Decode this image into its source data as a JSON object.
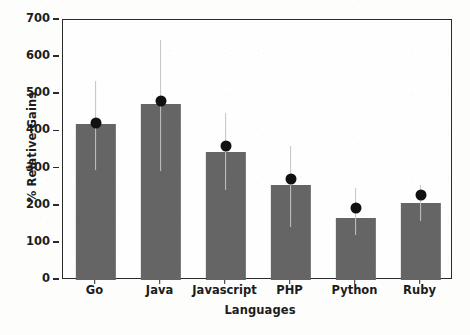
{
  "chart_data": {
    "type": "bar",
    "title": "",
    "xlabel": "Languages",
    "ylabel": "% Relative Gains",
    "categories": [
      "Go",
      "Java",
      "Javascript",
      "PHP",
      "Python",
      "Ruby"
    ],
    "values": [
      420,
      473,
      345,
      255,
      168,
      207
    ],
    "markers": [
      423,
      483,
      360,
      272,
      193,
      230
    ],
    "error_low": [
      295,
      293,
      243,
      144,
      120,
      159
    ],
    "error_high": [
      535,
      645,
      450,
      362,
      248,
      257
    ],
    "ylim": [
      0,
      700
    ],
    "yticks": [
      0,
      100,
      200,
      300,
      400,
      500,
      600,
      700
    ],
    "ytick_labels": [
      "0",
      "100",
      "200",
      "300",
      "400",
      "500",
      "600",
      "700"
    ],
    "grid": false,
    "legend": null,
    "bar_color": "#656565",
    "marker_color": "#111111",
    "error_color": "#c4c4c4",
    "axis_color": "#2a2a2a",
    "background_color": "#fefefe"
  }
}
